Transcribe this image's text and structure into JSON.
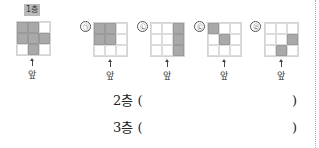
{
  "reference": {
    "label": "1층",
    "cells": [
      [
        1,
        1,
        0
      ],
      [
        1,
        1,
        1
      ],
      [
        0,
        1,
        0
      ]
    ],
    "front_label": "앞"
  },
  "options": [
    {
      "mark": "㉠",
      "cells": [
        [
          1,
          1,
          0
        ],
        [
          1,
          1,
          0
        ],
        [
          0,
          0,
          0
        ]
      ],
      "front_label": "앞"
    },
    {
      "mark": "㉡",
      "cells": [
        [
          0,
          0,
          1
        ],
        [
          0,
          0,
          1
        ],
        [
          0,
          0,
          1
        ]
      ],
      "front_label": "앞"
    },
    {
      "mark": "㉢",
      "cells": [
        [
          1,
          0,
          0
        ],
        [
          0,
          1,
          0
        ],
        [
          0,
          0,
          0
        ]
      ],
      "front_label": "앞"
    },
    {
      "mark": "㉣",
      "cells": [
        [
          0,
          0,
          0
        ],
        [
          0,
          0,
          1
        ],
        [
          0,
          1,
          0
        ]
      ],
      "front_label": "앞"
    }
  ],
  "answers": [
    {
      "label": "2층 (",
      "value": "",
      "close": ")"
    },
    {
      "label": "3층 (",
      "value": "",
      "close": ")"
    }
  ],
  "colors": {
    "shaded": "#a9a9a9",
    "grid_line": "#d4d4d4",
    "label_bg": "#b9b9b9"
  }
}
